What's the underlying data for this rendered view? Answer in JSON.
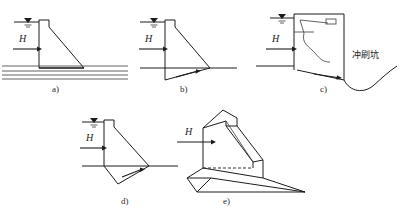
{
  "figure": {
    "background": "#ffffff",
    "line_color": "#1c1c1c",
    "subfigures": [
      {
        "id": "a",
        "caption": "a)",
        "force_label": "H",
        "water_symbol": "▽",
        "description": "dam on layered horizontal rock strata, sliding along base",
        "strata_lines": 4
      },
      {
        "id": "b",
        "caption": "b)",
        "force_label": "H",
        "water_symbol": "▽",
        "description": "dam sliding on shallow inclined failure plane below foundation"
      },
      {
        "id": "c",
        "caption": "c)",
        "force_label": "H",
        "water_symbol": "▽",
        "scour_label": "冲刷坑",
        "description": "overflow dam with gate, nappe and downstream scour pit"
      },
      {
        "id": "d",
        "caption": "d)",
        "force_label": "H",
        "water_symbol": "▽",
        "description": "dam sliding on deep trapezoidal failure wedge"
      },
      {
        "id": "e",
        "caption": "e)",
        "force_label": "H",
        "description": "three dimensional isometric view of dam and sliding wedge"
      }
    ]
  }
}
